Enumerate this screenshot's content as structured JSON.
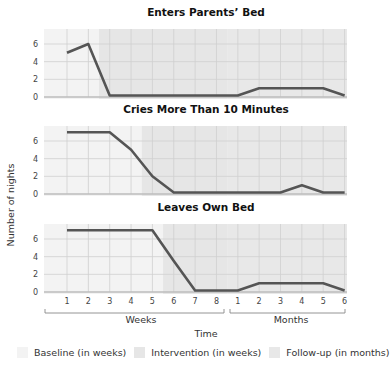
{
  "colors": {
    "baseline": "#f3f3f3",
    "intervention": "#e6e6e6",
    "followup": "#e8e8e8",
    "grid": "#cfcfcf",
    "line": "#555555",
    "axis": "#bdbdbd"
  },
  "chart_data": [
    {
      "type": "line",
      "title": "Enters Parents’ Bed",
      "x": [
        "W1",
        "W2",
        "W3",
        "W4",
        "W5",
        "W6",
        "W7",
        "W8",
        "M1",
        "M2",
        "M3",
        "M4",
        "M5",
        "M6"
      ],
      "values": [
        5,
        6,
        0,
        0,
        0,
        0,
        0,
        0,
        0,
        1,
        1,
        1,
        1,
        0
      ],
      "intervention_start_week": 2.5,
      "ylim": [
        0,
        7.5
      ],
      "yticks": [
        0,
        2,
        4,
        6
      ]
    },
    {
      "type": "line",
      "title": "Cries More Than 10 Minutes",
      "x": [
        "W1",
        "W2",
        "W3",
        "W4",
        "W5",
        "W6",
        "W7",
        "W8",
        "M1",
        "M2",
        "M3",
        "M4",
        "M5",
        "M6"
      ],
      "values": [
        7,
        7,
        7,
        5,
        2,
        0,
        0,
        0,
        0,
        0,
        0,
        1,
        0,
        0
      ],
      "intervention_start_week": 4.5,
      "ylim": [
        0,
        7.5
      ],
      "yticks": [
        0,
        2,
        4,
        6
      ]
    },
    {
      "type": "line",
      "title": "Leaves Own Bed",
      "x": [
        "W1",
        "W2",
        "W3",
        "W4",
        "W5",
        "W6",
        "W7",
        "W8",
        "M1",
        "M2",
        "M3",
        "M4",
        "M5",
        "M6"
      ],
      "values": [
        7,
        7,
        7,
        7,
        7,
        3.5,
        0,
        0,
        0,
        1,
        1,
        1,
        1,
        0
      ],
      "intervention_start_week": 5.5,
      "ylim": [
        0,
        7.5
      ],
      "yticks": [
        0,
        2,
        4,
        6
      ]
    }
  ],
  "axes": {
    "ylabel": "Number of nights",
    "xlabel": "Time",
    "week_ticks": [
      "1",
      "2",
      "3",
      "4",
      "5",
      "6",
      "7",
      "8"
    ],
    "month_ticks": [
      "1",
      "2",
      "3",
      "4",
      "5",
      "6"
    ],
    "weeks_label": "Weeks",
    "months_label": "Months"
  },
  "legend": [
    {
      "label": "Baseline (in weeks)",
      "key": "baseline"
    },
    {
      "label": "Intervention (in weeks)",
      "key": "intervention"
    },
    {
      "label": "Follow-up (in months)",
      "key": "followup"
    }
  ]
}
